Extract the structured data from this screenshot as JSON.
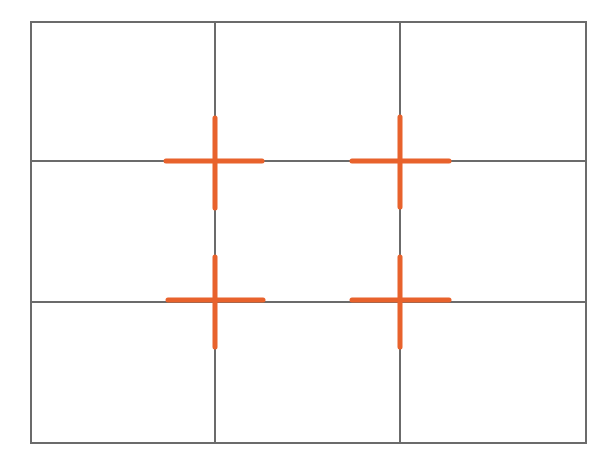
{
  "diagram": {
    "title": "Rule of thirds grid",
    "frame": {
      "x": 31,
      "y": 22,
      "width": 555,
      "height": 421
    },
    "grid": {
      "rows": 3,
      "columns": 3,
      "vertical_lines_x": [
        215,
        400
      ],
      "horizontal_lines_y": [
        161,
        302
      ]
    },
    "intersections": [
      {
        "name": "top-left-power-point",
        "x": 215,
        "y": 161,
        "h_arm": [
          166,
          262
        ],
        "v_arm": [
          118,
          208
        ]
      },
      {
        "name": "top-right-power-point",
        "x": 400,
        "y": 161,
        "h_arm": [
          352,
          449
        ],
        "v_arm": [
          117,
          207
        ]
      },
      {
        "name": "bottom-left-power-point",
        "x": 215,
        "y": 300,
        "h_arm": [
          168,
          263
        ],
        "v_arm": [
          257,
          347
        ]
      },
      {
        "name": "bottom-right-power-point",
        "x": 400,
        "y": 300,
        "h_arm": [
          352,
          449
        ],
        "v_arm": [
          257,
          347
        ]
      }
    ],
    "colors": {
      "background": "#ffffff",
      "grid_line": "#6b6b6b",
      "frame_line": "#6b6b6b",
      "marker": "#e8622c"
    }
  }
}
